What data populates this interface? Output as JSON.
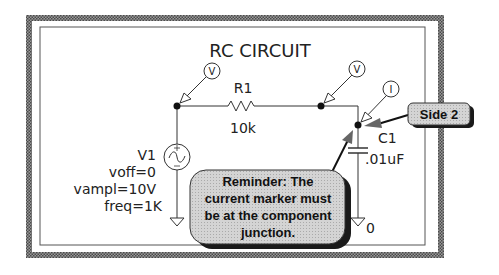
{
  "diagram": {
    "title": "RC CIRCUIT",
    "colors": {
      "frame": "#6e6e6e",
      "frame_light": "#9a9a9a",
      "wire": "#333333",
      "callout_fill": "#cfcfcf",
      "callout_shadow": "#1a1a1a",
      "background": "#ffffff"
    },
    "components": {
      "r1": {
        "name": "R1",
        "value": "10k"
      },
      "c1": {
        "name": "C1",
        "value": ".01uF"
      },
      "v1": {
        "name": "V1",
        "params": [
          "voff=0",
          "vampl=10V",
          "freq=1K"
        ]
      },
      "ground_label": "0"
    },
    "markers": {
      "voltage_left": "V",
      "voltage_mid": "V",
      "current": "I"
    },
    "callouts": {
      "side2": "Side 2",
      "reminder": [
        "Reminder: The",
        "current marker must",
        "be at the component",
        "junction."
      ]
    }
  }
}
